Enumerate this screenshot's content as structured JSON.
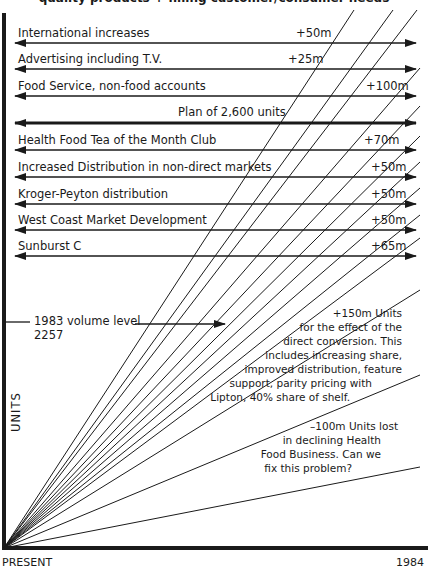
{
  "header": {
    "title": "quality products + filling customer/consumer needs"
  },
  "initiatives": [
    {
      "label": "International increases",
      "value": "+50m"
    },
    {
      "label": "Advertising including T.V.",
      "value": "+25m"
    },
    {
      "label": "Food Service, non-food accounts",
      "value": "+100m"
    },
    {
      "label": "Health Food Tea of the Month Club",
      "value": "+70m"
    },
    {
      "label": "Increased Distribution in non-direct markets",
      "value": "+50m"
    },
    {
      "label": "Kroger-Peyton distribution",
      "value": "+50m"
    },
    {
      "label": "West Coast Market Development",
      "value": "+50m"
    },
    {
      "label": "Sunburst C",
      "value": "+65m"
    }
  ],
  "plan": {
    "label": "Plan of 2,600 units"
  },
  "baseline": {
    "line1": "1983 volume level",
    "line2": "2257"
  },
  "notes": {
    "conversion": [
      "+150m Units",
      "for the effect of the",
      "direct conversion. This",
      "includes increasing share,",
      "improved distribution, feature",
      "support, parity pricing with",
      "Lipton, 40% share of shelf."
    ],
    "decline": [
      "–100m Units lost",
      "in declining Health",
      "Food Business. Can we",
      "fix this problem?"
    ]
  },
  "axes": {
    "y_label": "UNITS",
    "x_start": "PRESENT",
    "x_end": "1984"
  },
  "colors": {
    "ink": "#1a1a1a",
    "background": "#ffffff"
  }
}
